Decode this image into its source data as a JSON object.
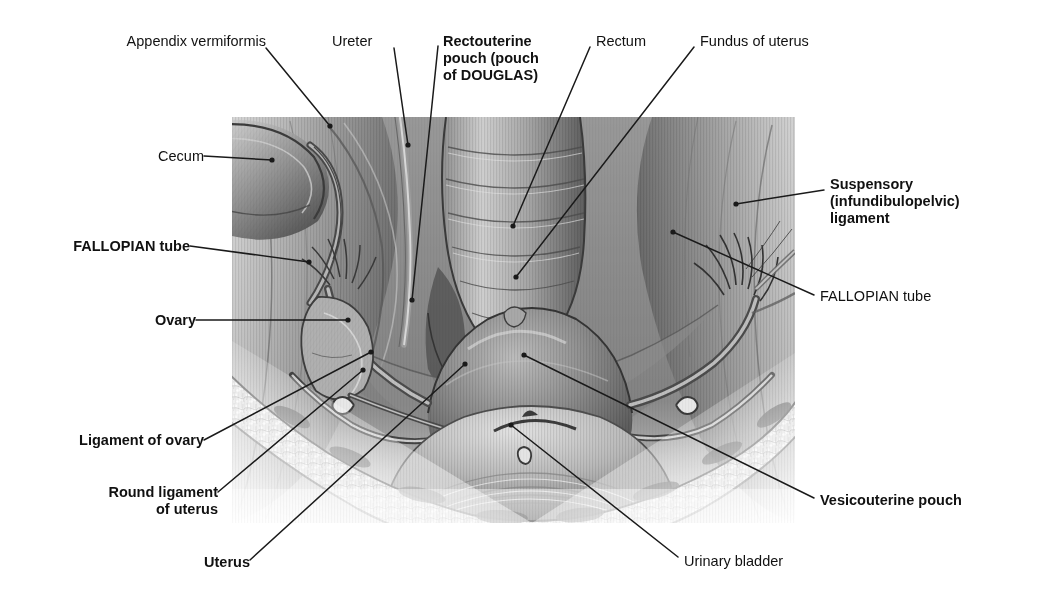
{
  "figure": {
    "plate": {
      "x": 232,
      "y": 117,
      "width": 563,
      "height": 406
    }
  },
  "colors": {
    "background": "#ffffff",
    "text": "#111111",
    "leader": "#1a1a1a",
    "plate_light": "#e9e9e9",
    "plate_mid": "#9a9a9a",
    "plate_dark": "#4a4a4a",
    "plate_deep": "#2c2c2c"
  },
  "labels": [
    {
      "id": "appendix-vermiformis",
      "text": "Appendix vermiformis",
      "bold": false,
      "align": "right",
      "x": 108,
      "y": 33,
      "leader": [
        [
          266,
          48
        ],
        [
          330,
          126
        ]
      ],
      "dot": true
    },
    {
      "id": "cecum",
      "text": "Cecum",
      "bold": false,
      "align": "right",
      "x": 142,
      "y": 148,
      "leader": [
        [
          204,
          156
        ],
        [
          272,
          160
        ]
      ],
      "dot": true
    },
    {
      "id": "ureter",
      "text": "Ureter",
      "bold": false,
      "align": "left",
      "x": 332,
      "y": 33,
      "leader": [
        [
          394,
          48
        ],
        [
          408,
          145
        ]
      ],
      "dot": true
    },
    {
      "id": "rectouterine-pouch",
      "text": "Rectouterine\npouch (pouch\nof DOUGLAS)",
      "bold": true,
      "align": "left",
      "x": 443,
      "y": 33,
      "leader": [
        [
          438,
          46
        ],
        [
          412,
          300
        ]
      ],
      "dot": true
    },
    {
      "id": "rectum",
      "text": "Rectum",
      "bold": false,
      "align": "left",
      "x": 596,
      "y": 33,
      "leader": [
        [
          590,
          47
        ],
        [
          513,
          226
        ]
      ],
      "dot": true
    },
    {
      "id": "fundus-of-uterus",
      "text": "Fundus of uterus",
      "bold": false,
      "align": "left",
      "x": 700,
      "y": 33,
      "leader": [
        [
          694,
          47
        ],
        [
          516,
          277
        ]
      ],
      "dot": true
    },
    {
      "id": "suspensory-ligament",
      "text": "Suspensory\n(infundibulopelvic)\nligament",
      "bold": true,
      "align": "left",
      "x": 830,
      "y": 176,
      "leader": [
        [
          824,
          190
        ],
        [
          736,
          204
        ]
      ],
      "dot": true
    },
    {
      "id": "fallopian-tube-right",
      "text": "FALLOPIAN tube",
      "bold": false,
      "align": "left",
      "x": 820,
      "y": 288,
      "leader": [
        [
          814,
          295
        ],
        [
          673,
          232
        ]
      ],
      "dot": true
    },
    {
      "id": "fallopian-tube-left",
      "text": "FALLOPIAN tube",
      "bold": true,
      "align": "right",
      "x": 30,
      "y": 238,
      "leader": [
        [
          190,
          246
        ],
        [
          309,
          262
        ]
      ],
      "dot": true
    },
    {
      "id": "ovary",
      "text": "Ovary",
      "bold": true,
      "align": "right",
      "x": 140,
      "y": 312,
      "leader": [
        [
          196,
          320
        ],
        [
          348,
          320
        ]
      ],
      "dot": true
    },
    {
      "id": "ligament-of-ovary",
      "text": "Ligament of ovary",
      "bold": true,
      "align": "right",
      "x": 48,
      "y": 432,
      "leader": [
        [
          204,
          440
        ],
        [
          371,
          352
        ]
      ],
      "dot": true
    },
    {
      "id": "round-ligament-of-uterus",
      "text": "Round ligament\nof uterus",
      "bold": true,
      "align": "right",
      "x": 62,
      "y": 484,
      "leader": [
        [
          218,
          492
        ],
        [
          363,
          370
        ]
      ],
      "dot": true
    },
    {
      "id": "uterus",
      "text": "Uterus",
      "bold": true,
      "align": "right",
      "x": 186,
      "y": 554,
      "leader": [
        [
          250,
          560
        ],
        [
          465,
          364
        ]
      ],
      "dot": true
    },
    {
      "id": "urinary-bladder",
      "text": "Urinary bladder",
      "bold": false,
      "align": "left",
      "x": 684,
      "y": 553,
      "leader": [
        [
          678,
          557
        ],
        [
          511,
          425
        ]
      ],
      "dot": true
    },
    {
      "id": "vesicouterine-pouch",
      "text": "Vesicouterine pouch",
      "bold": true,
      "align": "left",
      "x": 820,
      "y": 492,
      "leader": [
        [
          814,
          498
        ],
        [
          524,
          355
        ]
      ],
      "dot": true
    }
  ]
}
